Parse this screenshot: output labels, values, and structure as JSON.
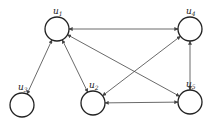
{
  "diagram": {
    "type": "directed-graph",
    "nodes": [
      {
        "id": "u1",
        "label": "u",
        "sub": "1",
        "cx": 57,
        "cy": 29
      },
      {
        "id": "u2",
        "label": "u",
        "sub": "2",
        "cx": 93,
        "cy": 103
      },
      {
        "id": "u3",
        "label": "u",
        "sub": "3",
        "cx": 22,
        "cy": 105
      },
      {
        "id": "u4",
        "label": "u",
        "sub": "4",
        "cx": 190,
        "cy": 29
      },
      {
        "id": "u5",
        "label": "u",
        "sub": "5",
        "cx": 190,
        "cy": 102
      }
    ],
    "edges": [
      {
        "from": "u1",
        "to": "u4",
        "bidirectional": true
      },
      {
        "from": "u1",
        "to": "u3",
        "bidirectional": true
      },
      {
        "from": "u1",
        "to": "u2",
        "bidirectional": true
      },
      {
        "from": "u1",
        "to": "u5",
        "bidirectional": true
      },
      {
        "from": "u2",
        "to": "u4",
        "bidirectional": true
      },
      {
        "from": "u2",
        "to": "u5",
        "bidirectional": true
      },
      {
        "from": "u4",
        "to": "u5",
        "bidirectional": true
      }
    ]
  }
}
